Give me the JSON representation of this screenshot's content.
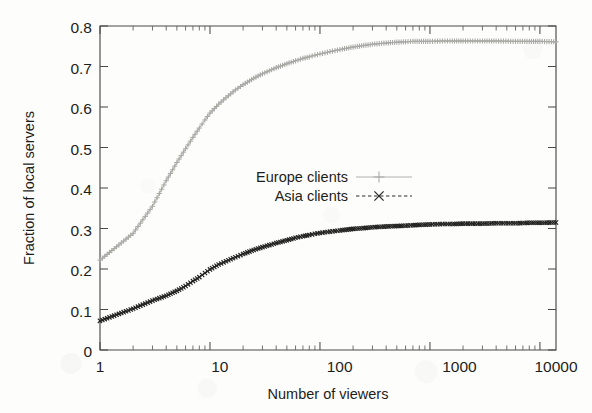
{
  "chart_data": {
    "type": "line",
    "title": "",
    "xlabel": "Number of viewers",
    "ylabel": "Fraction of local servers",
    "xscale": "log",
    "xlim": [
      1,
      14000
    ],
    "ylim": [
      0,
      0.8
    ],
    "grid": false,
    "legend_position": "center",
    "x_tick_labels": [
      "1",
      "10",
      "100",
      "1000",
      "10000"
    ],
    "x_tick_values": [
      1,
      10,
      100,
      1000,
      10000
    ],
    "y_tick_labels": [
      "0",
      "0.1",
      "0.2",
      "0.3",
      "0.4",
      "0.5",
      "0.6",
      "0.7",
      "0.8"
    ],
    "y_tick_values": [
      0,
      0.1,
      0.2,
      0.3,
      0.4,
      0.5,
      0.6,
      0.7,
      0.8
    ],
    "series": [
      {
        "name": "Europe clients",
        "color": "#b2b2ae",
        "linestyle": "solid",
        "marker": "plus",
        "x": [
          1,
          2,
          3,
          4,
          5,
          6,
          7,
          8,
          9,
          10,
          12,
          14,
          17,
          20,
          25,
          30,
          40,
          50,
          60,
          70,
          80,
          90,
          100,
          130,
          160,
          200,
          250,
          300,
          400,
          500,
          600,
          700,
          800,
          1000,
          1300,
          1600,
          2000,
          3000,
          4000,
          6000,
          8000,
          10000,
          14000
        ],
        "y": [
          0.222,
          0.288,
          0.355,
          0.418,
          0.463,
          0.497,
          0.525,
          0.548,
          0.568,
          0.585,
          0.607,
          0.623,
          0.642,
          0.655,
          0.671,
          0.682,
          0.697,
          0.707,
          0.714,
          0.72,
          0.724,
          0.728,
          0.731,
          0.738,
          0.743,
          0.748,
          0.752,
          0.755,
          0.758,
          0.76,
          0.761,
          0.762,
          0.762,
          0.762,
          0.763,
          0.763,
          0.763,
          0.763,
          0.763,
          0.762,
          0.762,
          0.762,
          0.761
        ]
      },
      {
        "name": "Asia clients",
        "color": "#2c2c2a",
        "linestyle": "dashed",
        "marker": "cross",
        "x": [
          1,
          2,
          3,
          4,
          5,
          6,
          7,
          8,
          9,
          10,
          12,
          14,
          17,
          20,
          25,
          30,
          40,
          50,
          60,
          70,
          80,
          90,
          100,
          130,
          160,
          200,
          250,
          300,
          400,
          500,
          600,
          700,
          800,
          1000,
          1300,
          1600,
          2000,
          3000,
          4000,
          6000,
          8000,
          10000,
          14000
        ],
        "y": [
          0.072,
          0.102,
          0.122,
          0.134,
          0.146,
          0.158,
          0.17,
          0.18,
          0.19,
          0.199,
          0.211,
          0.219,
          0.229,
          0.237,
          0.247,
          0.254,
          0.264,
          0.271,
          0.277,
          0.281,
          0.284,
          0.287,
          0.289,
          0.293,
          0.296,
          0.299,
          0.301,
          0.303,
          0.305,
          0.306,
          0.307,
          0.308,
          0.309,
          0.31,
          0.311,
          0.311,
          0.312,
          0.312,
          0.313,
          0.313,
          0.314,
          0.314,
          0.315
        ]
      }
    ],
    "legend": [
      {
        "label": "Europe clients",
        "color": "#b2b2ae",
        "marker": "plus",
        "linestyle": "solid"
      },
      {
        "label": "Asia clients",
        "color": "#2c2c2a",
        "marker": "cross",
        "linestyle": "dashed"
      }
    ]
  },
  "figure": {
    "xlabel": "Number of viewers",
    "ylabel": "Fraction of local servers",
    "legend_europe": "Europe clients",
    "legend_asia": "Asia clients",
    "y0": "0",
    "y1": "0.1",
    "y2": "0.2",
    "y3": "0.3",
    "y4": "0.4",
    "y5": "0.5",
    "y6": "0.6",
    "y7": "0.7",
    "y8": "0.8",
    "x0": "1",
    "x1": "10",
    "x2": "100",
    "x3": "1000",
    "x4": "10000"
  }
}
